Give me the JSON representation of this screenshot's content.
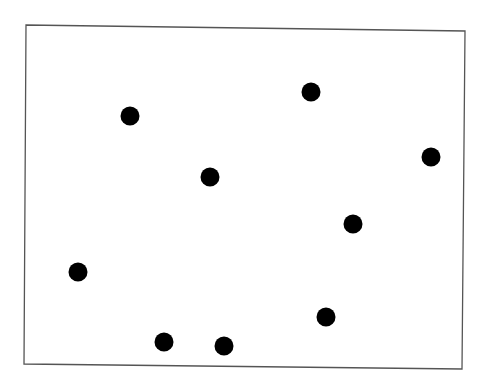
{
  "frame": {
    "corners": [
      [
        26,
        25
      ],
      [
        465,
        31
      ],
      [
        462,
        369
      ],
      [
        24,
        364
      ]
    ],
    "stroke": "#555555",
    "stroke_width": 1.3,
    "fill": "#ffffff"
  },
  "dots": {
    "color": "#000000",
    "radius": 9.5,
    "points": [
      {
        "x": 130,
        "y": 116
      },
      {
        "x": 311,
        "y": 92
      },
      {
        "x": 431,
        "y": 157
      },
      {
        "x": 210,
        "y": 177
      },
      {
        "x": 353,
        "y": 224
      },
      {
        "x": 78,
        "y": 272
      },
      {
        "x": 326,
        "y": 317
      },
      {
        "x": 164,
        "y": 342
      },
      {
        "x": 224,
        "y": 346
      }
    ]
  }
}
